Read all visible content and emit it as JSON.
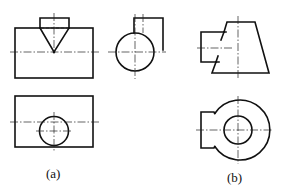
{
  "figure": {
    "labels": {
      "a": "(a)",
      "b": "(b)"
    },
    "colors": {
      "line": "#111111",
      "background": "#ffffff"
    },
    "views": [
      {
        "id": "a-front",
        "description": "Front view: rectangle body with V-notch cap on top"
      },
      {
        "id": "a-side",
        "description": "Side view: circle with rectangular boss at top right"
      },
      {
        "id": "a-top",
        "description": "Top view: rectangle with circle near bottom edge"
      },
      {
        "id": "b-front",
        "description": "Front view: trapezoid with rectangular stub on left"
      },
      {
        "id": "b-top",
        "description": "Top view: concentric circles with rectangular stub on left"
      }
    ]
  }
}
